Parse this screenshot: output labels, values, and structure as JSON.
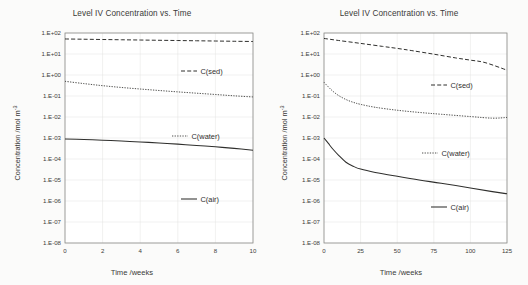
{
  "figure": {
    "caption": "",
    "panels": [
      "left",
      "right"
    ]
  },
  "common": {
    "title": "Level IV Concentration vs. Time",
    "ylabel_main": "Concentration /mol m",
    "ylabel_sup": "-3",
    "xlabel": "Time /weeks",
    "yticks": [
      "1.E+02",
      "1.E+01",
      "1.E+00",
      "1.E-01",
      "1.E-02",
      "1.E-03",
      "1.E-04",
      "1.E-05",
      "1.E-06",
      "1.E-07",
      "1.E-08"
    ],
    "legend": [
      {
        "label": "C(sed)",
        "style": "dashed"
      },
      {
        "label": "C(water)",
        "style": "dotted"
      },
      {
        "label": "C(air)",
        "style": "solid"
      }
    ],
    "colors": {
      "line": "#2f2f2d",
      "grid": "#e3e3e1",
      "axis": "#8d8d8a",
      "text": "#3a3a38",
      "background": "#fbfbfa",
      "plot_background": "#ffffff"
    }
  },
  "chart_data": [
    {
      "type": "line",
      "panel": "left",
      "title": "Level IV Concentration vs. Time",
      "xlabel": "Time /weeks",
      "ylabel": "Concentration /mol m-3",
      "yscale": "log",
      "ylim": [
        1e-08,
        100.0
      ],
      "xlim": [
        0,
        10
      ],
      "xticks": [
        "0",
        "2",
        "4",
        "6",
        "8",
        "10"
      ],
      "xtick_values": [
        0,
        2,
        4,
        6,
        8,
        10
      ],
      "yticks": [
        "1.E+02",
        "1.E+01",
        "1.E+00",
        "1.E-01",
        "1.E-02",
        "1.E-03",
        "1.E-04",
        "1.E-05",
        "1.E-06",
        "1.E-07",
        "1.E-08"
      ],
      "ytick_values": [
        100,
        10,
        1,
        0.1,
        0.01,
        0.001,
        0.0001,
        1e-05,
        1e-06,
        1e-07,
        1e-08
      ],
      "grid": true,
      "legend_position": "inside-right",
      "series": [
        {
          "name": "C(sed)",
          "style": "dashed",
          "x": [
            0,
            1,
            2,
            3,
            4,
            5,
            6,
            7,
            8,
            9,
            10
          ],
          "y": [
            52,
            50.5,
            49,
            47.6,
            46.3,
            45,
            43.8,
            42.6,
            41.5,
            40.4,
            39.4
          ]
        },
        {
          "name": "C(water)",
          "style": "dotted",
          "x": [
            0,
            1,
            2,
            3,
            4,
            5,
            6,
            7,
            8,
            9,
            10
          ],
          "y": [
            0.5,
            0.39,
            0.31,
            0.255,
            0.215,
            0.183,
            0.157,
            0.136,
            0.118,
            0.102,
            0.09
          ]
        },
        {
          "name": "C(air)",
          "style": "solid",
          "x": [
            0,
            1,
            2,
            3,
            4,
            5,
            6,
            7,
            8,
            9,
            10
          ],
          "y": [
            0.0009,
            0.00085,
            0.00079,
            0.00072,
            0.00065,
            0.00058,
            0.00051,
            0.00044,
            0.00038,
            0.00032,
            0.00026
          ]
        }
      ]
    },
    {
      "type": "line",
      "panel": "right",
      "title": "Level IV Concentration vs. Time",
      "xlabel": "Time /weeks",
      "ylabel": "Concentration /mol m-3",
      "yscale": "log",
      "ylim": [
        1e-08,
        100.0
      ],
      "xlim": [
        0,
        125
      ],
      "xticks": [
        "0",
        "25",
        "50",
        "75",
        "100",
        "125"
      ],
      "xtick_values": [
        0,
        25,
        50,
        75,
        100,
        125
      ],
      "yticks": [
        "1.E+02",
        "1.E+01",
        "1.E+00",
        "1.E-01",
        "1.E-02",
        "1.E-03",
        "1.E-04",
        "1.E-05",
        "1.E-06",
        "1.E-07",
        "1.E-08"
      ],
      "ytick_values": [
        100,
        10,
        1,
        0.1,
        0.01,
        0.001,
        0.0001,
        1e-05,
        1e-06,
        1e-07,
        1e-08
      ],
      "grid": true,
      "legend_position": "inside-right",
      "series": [
        {
          "name": "C(sed)",
          "style": "dashed",
          "x": [
            0,
            10,
            25,
            40,
            50,
            60,
            75,
            90,
            100,
            110,
            125
          ],
          "y": [
            55,
            44,
            32,
            23,
            18.5,
            14.5,
            9.8,
            6.5,
            5.1,
            3.9,
            1.7
          ]
        },
        {
          "name": "C(water)",
          "style": "dotted",
          "x": [
            0,
            3,
            6,
            10,
            15,
            20,
            25,
            35,
            50,
            65,
            80,
            100,
            115,
            125
          ],
          "y": [
            0.45,
            0.27,
            0.17,
            0.105,
            0.068,
            0.05,
            0.04,
            0.029,
            0.021,
            0.0165,
            0.0135,
            0.0105,
            0.0088,
            0.0095
          ]
        },
        {
          "name": "C(air)",
          "style": "solid",
          "x": [
            0,
            3,
            6,
            10,
            15,
            20,
            25,
            35,
            50,
            65,
            80,
            100,
            115,
            125
          ],
          "y": [
            0.001,
            0.00055,
            0.0003,
            0.00015,
            7e-05,
            4.5e-05,
            3.3e-05,
            2.3e-05,
            1.5e-05,
            1e-05,
            7e-06,
            4.2e-06,
            2.8e-06,
            2.2e-06
          ]
        }
      ]
    }
  ]
}
